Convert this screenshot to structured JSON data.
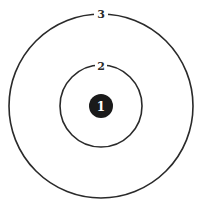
{
  "diagram": {
    "type": "concentric-circles",
    "center": {
      "x": 101,
      "y": 106
    },
    "colors": {
      "stroke": "#2a2a2a",
      "core_fill": "#1a1a1a",
      "core_text": "#ffffff",
      "background": "#ffffff"
    },
    "elements": [
      {
        "id": "core",
        "label": "1",
        "radius": 12,
        "filled": true
      },
      {
        "id": "inner-ring",
        "label": "2",
        "radius": 41,
        "filled": false
      },
      {
        "id": "outer-ring",
        "label": "3",
        "radius": 92,
        "filled": false
      }
    ]
  }
}
